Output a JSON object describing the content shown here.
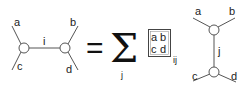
{
  "left_diagram": {
    "labels": {
      "a": "a",
      "b": "b",
      "c": "c",
      "d": "d",
      "internal": "i"
    }
  },
  "equation": {
    "equals": "=",
    "sum_symbol": "Σ",
    "sum_index": "j"
  },
  "matrix_box": {
    "row1": {
      "left": "a",
      "right": "b"
    },
    "row2": {
      "left": "c",
      "right": "d"
    },
    "subscript": "ij"
  },
  "right_diagram": {
    "labels": {
      "a": "a",
      "b": "b",
      "c": "c",
      "d": "d",
      "internal": "j"
    }
  },
  "colors": {
    "line": "#555555",
    "text": "#222222",
    "background": "#ffffff"
  }
}
